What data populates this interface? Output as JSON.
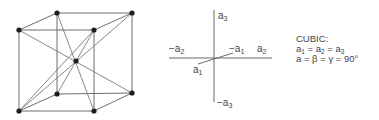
{
  "cube": {
    "type": "body-centered cubic unit cell",
    "vertices": {
      "back_top_left": [
        57,
        13
      ],
      "back_top_right": [
        132,
        13
      ],
      "front_top_left": [
        19,
        30
      ],
      "front_top_right": [
        94,
        30
      ],
      "back_bottom_left": [
        57,
        94
      ],
      "back_bottom_right": [
        132,
        93
      ],
      "front_bottom_left": [
        19,
        111
      ],
      "front_bottom_right": [
        94,
        111
      ],
      "center": [
        76,
        61
      ]
    }
  },
  "axes": {
    "labels": {
      "pos_a3": "a",
      "pos_a3_sub": "3",
      "neg_a3": "−a",
      "neg_a3_sub": "3",
      "pos_a2": "a",
      "pos_a2_sub": "2",
      "neg_a2": "−a",
      "neg_a2_sub": "2",
      "pos_a1": "a",
      "pos_a1_sub": "1",
      "neg_a1": "−a",
      "neg_a1_sub": "1"
    }
  },
  "properties": {
    "title": "CUBIC:",
    "line1": {
      "a": "a",
      "s1": "1",
      "eq1": " = a",
      "s2": "2",
      "eq2": " = a",
      "s3": "3"
    },
    "line2": "a = β = γ = 90°"
  }
}
